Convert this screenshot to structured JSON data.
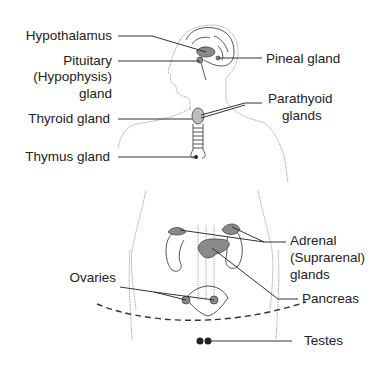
{
  "diagram": {
    "labels_left": [
      {
        "id": "hypothalamus",
        "text": "Hypothalamus"
      },
      {
        "id": "pituitary",
        "lines": [
          "Pituitary",
          "(Hypophysis)",
          "gland"
        ]
      },
      {
        "id": "thyroid",
        "text": "Thyroid gland"
      },
      {
        "id": "thymus",
        "text": "Thymus gland"
      },
      {
        "id": "ovaries",
        "text": "Ovaries"
      }
    ],
    "labels_right": [
      {
        "id": "pineal",
        "text": "Pineal gland"
      },
      {
        "id": "parathyroid",
        "lines": [
          "Parathyoid",
          "glands"
        ]
      },
      {
        "id": "adrenal",
        "lines": [
          "Adrenal",
          "(Suprarenal)",
          "glands"
        ]
      },
      {
        "id": "pancreas",
        "text": "Pancreas"
      },
      {
        "id": "testes",
        "text": "Testes"
      }
    ],
    "colors": {
      "text": "#222222",
      "leader": "#333333",
      "outline": "#9a9a9a",
      "gland_fill": "#8a8a8a"
    }
  }
}
